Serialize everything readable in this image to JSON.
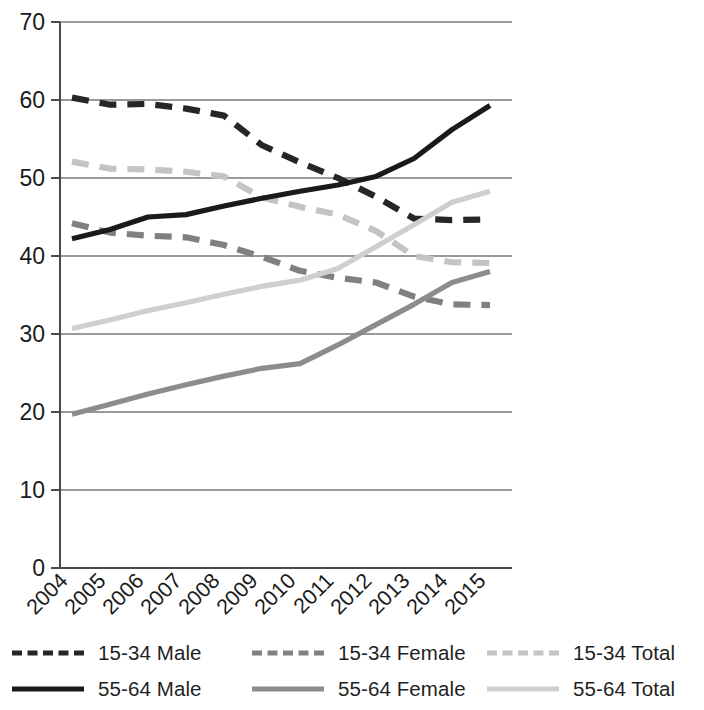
{
  "chart_data": {
    "type": "line",
    "title": "",
    "subtitle": "",
    "xlabel": "",
    "ylabel": "",
    "x": [
      "2004",
      "2005",
      "2006",
      "2007",
      "2008",
      "2009",
      "2010",
      "2011",
      "2012",
      "2013",
      "2014",
      "2015"
    ],
    "categories": [
      "2004",
      "2005",
      "2006",
      "2007",
      "2008",
      "2009",
      "2010",
      "2011",
      "2012",
      "2013",
      "2014",
      "2015"
    ],
    "ylim": [
      0,
      70
    ],
    "yticks": [
      0,
      10,
      20,
      30,
      40,
      50,
      60,
      70
    ],
    "ytick_labels": [
      "0",
      "10",
      "20",
      "30",
      "40",
      "50",
      "60",
      "70"
    ],
    "grid": "horizontal",
    "legend_position": "bottom",
    "series": [
      {
        "name": "15-34 Male",
        "style": "dashed",
        "color": "#262626",
        "values": [
          60.3,
          59.4,
          59.5,
          58.9,
          58.0,
          54.2,
          52.0,
          50.0,
          47.6,
          44.8,
          44.6,
          44.7
        ]
      },
      {
        "name": "15-34 Female",
        "style": "dashed",
        "color": "#808080",
        "values": [
          44.2,
          43.0,
          42.6,
          42.4,
          41.4,
          39.9,
          38.1,
          37.2,
          36.6,
          34.8,
          33.8,
          33.7
        ]
      },
      {
        "name": "15-34 Total",
        "style": "dashed",
        "color": "#c4c4c4",
        "values": [
          52.1,
          51.2,
          51.1,
          50.8,
          50.2,
          47.5,
          46.3,
          45.3,
          43.2,
          40.0,
          39.2,
          39.1
        ]
      },
      {
        "name": "55-64 Male",
        "style": "solid",
        "color": "#1a1a1a",
        "values": [
          42.2,
          43.4,
          45.0,
          45.3,
          46.4,
          47.4,
          48.3,
          49.1,
          50.2,
          52.5,
          56.2,
          59.3
        ]
      },
      {
        "name": "55-64 Female",
        "style": "solid",
        "color": "#8c8c8c",
        "values": [
          19.7,
          21.0,
          22.3,
          23.5,
          24.6,
          25.6,
          26.2,
          28.6,
          31.2,
          33.8,
          36.6,
          38.0
        ]
      },
      {
        "name": "55-64 Total",
        "style": "solid",
        "color": "#cfcfcf",
        "values": [
          30.7,
          31.8,
          33.0,
          34.0,
          35.1,
          36.1,
          36.9,
          38.4,
          41.2,
          44.0,
          46.9,
          48.3
        ]
      }
    ]
  },
  "legend": {
    "items": [
      {
        "label": "15-34 Male",
        "style": "dashed",
        "color": "#262626"
      },
      {
        "label": "15-34 Female",
        "style": "dashed",
        "color": "#808080"
      },
      {
        "label": "15-34 Total",
        "style": "dashed",
        "color": "#c4c4c4"
      },
      {
        "label": "55-64 Male",
        "style": "solid",
        "color": "#1a1a1a"
      },
      {
        "label": "55-64 Female",
        "style": "solid",
        "color": "#8c8c8c"
      },
      {
        "label": "55-64 Total",
        "style": "solid",
        "color": "#cfcfcf"
      }
    ]
  },
  "axis": {
    "y_tick_label_color": "#1a1a1a",
    "x_tick_label_color": "#1a1a1a",
    "gridline_color": "#9a9a9a",
    "axis_line_color": "#4a4a4a"
  }
}
